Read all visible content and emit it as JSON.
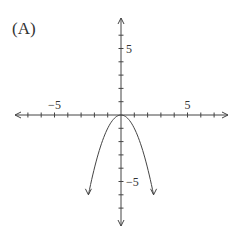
{
  "panel_label": "(A)",
  "chart_data": {
    "type": "line",
    "title": "",
    "xlabel": "",
    "ylabel": "",
    "xlim": [
      -8,
      7.5
    ],
    "ylim": [
      -8,
      7.5
    ],
    "grid": false,
    "x_tick_labels": [
      {
        "value": -5,
        "label": "−5"
      },
      {
        "value": 5,
        "label": "5"
      }
    ],
    "y_tick_labels": [
      {
        "value": 5,
        "label": "5"
      },
      {
        "value": -5,
        "label": "−5"
      }
    ],
    "series": [
      {
        "name": "y = -x^2",
        "function": "-x^2",
        "x_range": [
          -2.45,
          2.45
        ],
        "points": [
          [
            -2.4,
            -5.76
          ],
          [
            -2,
            -4
          ],
          [
            -1,
            -1
          ],
          [
            0,
            0
          ],
          [
            1,
            -1
          ],
          [
            2,
            -4
          ],
          [
            2.4,
            -5.76
          ]
        ]
      }
    ],
    "colors": {
      "axis": "#444444",
      "curve": "#444444"
    }
  }
}
